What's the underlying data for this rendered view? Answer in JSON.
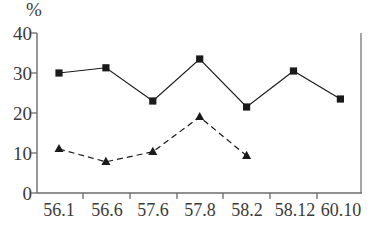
{
  "chart_data": {
    "type": "line",
    "title": "",
    "subtitle": "",
    "xlabel": "",
    "ylabel": "%",
    "ylim": [
      0,
      40
    ],
    "yticks": [
      0,
      10,
      20,
      30,
      40
    ],
    "grid": false,
    "legend": "none",
    "categories": [
      "56.1",
      "56.6",
      "57.6",
      "57.8",
      "58.2",
      "58.12",
      "60.10"
    ],
    "series": [
      {
        "name": "solid-square-series",
        "marker": "square",
        "linestyle": "solid",
        "color": "#1a1a1a",
        "values": [
          30.0,
          31.3,
          23.0,
          33.5,
          21.5,
          30.5,
          23.5
        ]
      },
      {
        "name": "dashed-triangle-series",
        "marker": "triangle",
        "linestyle": "dashed",
        "color": "#1a1a1a",
        "values": [
          11.0,
          7.8,
          10.3,
          19.0,
          9.3,
          null,
          null
        ]
      }
    ]
  },
  "axis": {
    "unit_label": "%",
    "y_tick_labels": [
      "40",
      "30",
      "20",
      "10",
      "0"
    ],
    "x_tick_labels": [
      "56.1",
      "56.6",
      "57.6",
      "57.8",
      "58.2",
      "58.12",
      "60.10"
    ]
  },
  "colors": {
    "ink": "#1a1a1a",
    "axis": "#6b6b6b",
    "text": "#3a3a3a",
    "background": "#ffffff"
  }
}
